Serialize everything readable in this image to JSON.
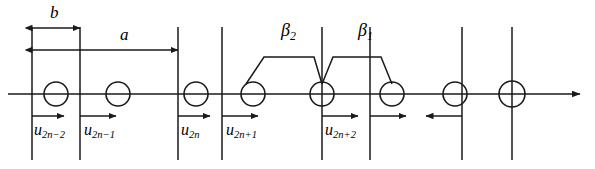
{
  "figure": {
    "type": "diatomic-linear-chain-lattice-diagram",
    "background_color": "#ffffff",
    "line_color": "#1a1a1a",
    "width": 595,
    "height": 169
  },
  "dimensions": {
    "b": {
      "label": "b",
      "x": 50,
      "y": 8,
      "from_x": 32,
      "to_x": 80,
      "arrow_y": 28,
      "style": "double-headed"
    },
    "a": {
      "label": "a",
      "x": 122,
      "y": 28,
      "from_x": 32,
      "to_x": 178,
      "arrow_y": 50,
      "style": "double-headed"
    }
  },
  "bonds": [
    {
      "label": "β",
      "subscript": "2",
      "x": 287,
      "y": 22,
      "left_x": 253,
      "right_x": 322,
      "top_y": 57
    },
    {
      "label": "β",
      "subscript": "1",
      "x": 364,
      "y": 22,
      "left_x": 322,
      "right_x": 390,
      "top_y": 57
    }
  ],
  "axis": {
    "y": 94,
    "start_x": 8,
    "end_x": 586,
    "arrow": "right"
  },
  "lattice": {
    "atom_radius": 12,
    "atom_centers_x": [
      56,
      100,
      178,
      200,
      253,
      322,
      390,
      462,
      512
    ],
    "vertical_lines_x": [
      32,
      80,
      178,
      222,
      322,
      370,
      462,
      512
    ],
    "vertical_line_top_y": 27,
    "vertical_line_bottom_y": 160
  },
  "displacements": [
    {
      "id": "u-2n-2",
      "label": "u",
      "subscript": "2n−2",
      "x": 36,
      "y": 128,
      "arrow_from_x": 32,
      "arrow_to_x": 66,
      "arrow_y": 116,
      "direction": "right"
    },
    {
      "id": "u-2n-1",
      "label": "u",
      "subscript": "2n−1",
      "x": 86,
      "y": 128,
      "arrow_from_x": 80,
      "arrow_to_x": 118,
      "arrow_y": 116,
      "direction": "right"
    },
    {
      "id": "u-2n",
      "label": "u",
      "subscript": "2n",
      "x": 182,
      "y": 128,
      "arrow_from_x": 178,
      "arrow_to_x": 212,
      "arrow_y": 116,
      "direction": "right"
    },
    {
      "id": "u-2n+1",
      "label": "u",
      "subscript": "2n+1",
      "x": 228,
      "y": 128,
      "arrow_from_x": 222,
      "arrow_to_x": 260,
      "arrow_y": 116,
      "direction": "right"
    },
    {
      "id": "u-2n+2",
      "label": "u",
      "subscript": "2n+2",
      "x": 327,
      "y": 128,
      "arrow_from_x": 322,
      "arrow_to_x": 360,
      "arrow_y": 116,
      "direction": "right"
    },
    {
      "id": "u-unlabeled-right",
      "label": "",
      "subscript": "",
      "x": 0,
      "y": 0,
      "arrow_from_x": 370,
      "arrow_to_x": 408,
      "arrow_y": 116,
      "direction": "right"
    },
    {
      "id": "u-unlabeled-left",
      "label": "",
      "subscript": "",
      "x": 0,
      "y": 0,
      "arrow_from_x": 462,
      "arrow_to_x": 424,
      "arrow_y": 116,
      "direction": "left"
    }
  ]
}
